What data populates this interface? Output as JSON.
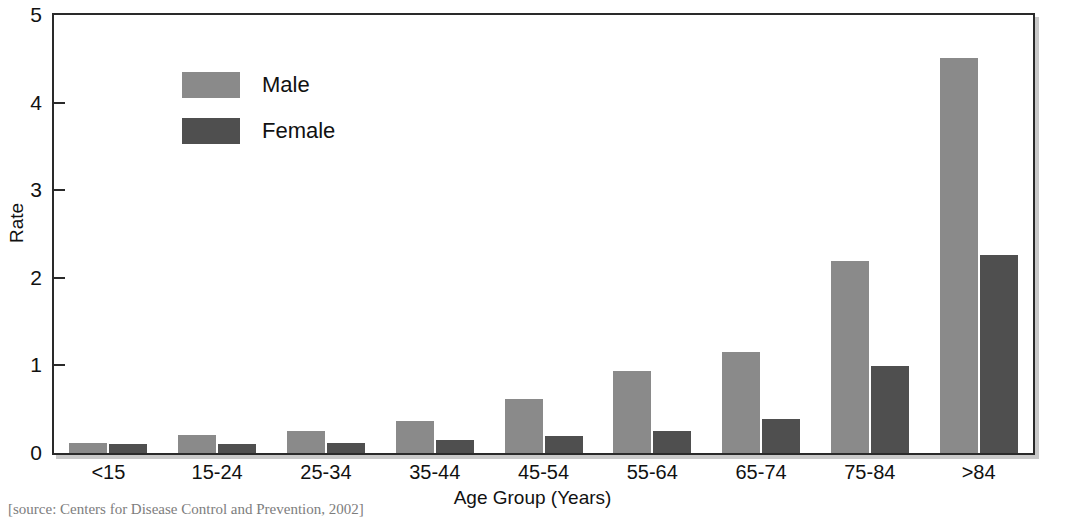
{
  "chart_data": {
    "type": "bar",
    "title": "",
    "xlabel": "Age Group (Years)",
    "ylabel": "Rate",
    "ylim": [
      0,
      5
    ],
    "yticks": [
      "0",
      "1",
      "2",
      "3",
      "4",
      "5"
    ],
    "grid": false,
    "legend_position": "upper-left-inside",
    "categories": [
      "<15",
      "15-24",
      "25-34",
      "35-44",
      "45-54",
      "55-64",
      "65-74",
      "75-84",
      ">84"
    ],
    "series": [
      {
        "name": "Male",
        "color": "#8a8a8a",
        "values": [
          0.11,
          0.2,
          0.25,
          0.37,
          0.62,
          0.94,
          1.15,
          2.19,
          4.51
        ]
      },
      {
        "name": "Female",
        "color": "#4f4f4f",
        "values": [
          0.1,
          0.1,
          0.12,
          0.15,
          0.19,
          0.25,
          0.39,
          0.99,
          2.26
        ]
      }
    ]
  },
  "caption": "[source: Centers for Disease Control and Prevention, 2002]",
  "colors": {
    "male": "#8a8a8a",
    "female": "#4f4f4f",
    "axis": "#2a2a2a",
    "shadow": "#cfcfcf",
    "background": "#ffffff"
  }
}
